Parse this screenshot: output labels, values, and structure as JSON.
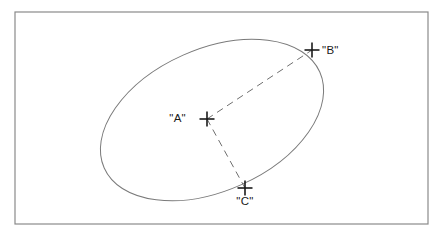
{
  "figure": {
    "kind": "geometry-diagram",
    "background_color": "#ffffff",
    "frame": {
      "name": "outer-frame",
      "x": 15,
      "y": 12,
      "width": 413,
      "height": 212,
      "stroke_color": "#8a8a8a",
      "stroke_width": 1.2,
      "fill": "none"
    },
    "ellipse": {
      "name": "ellipse-shape",
      "cx": 212,
      "cy": 120,
      "rx": 118,
      "ry": 71,
      "rotation_deg": -24,
      "stroke_color": "#7a7a7a",
      "stroke_width": 1,
      "fill": "none"
    },
    "points": [
      {
        "id": "A",
        "label": "\"A\"",
        "x": 207,
        "y": 119,
        "label_x": 186,
        "label_y": 122,
        "label_anchor": "end",
        "marker": "plus-cross",
        "marker_size": 7.5,
        "marker_color": "#1a1a1a",
        "marker_stroke_width": 1.6,
        "role": "center"
      },
      {
        "id": "B",
        "label": "\"B\"",
        "x": 312,
        "y": 50,
        "label_x": 322,
        "label_y": 54,
        "label_anchor": "start",
        "marker": "plus-cross",
        "marker_size": 7.5,
        "marker_color": "#1a1a1a",
        "marker_stroke_width": 1.6,
        "role": "on-ellipse"
      },
      {
        "id": "C",
        "label": "\"C\"",
        "x": 245,
        "y": 188,
        "label_x": 245,
        "label_y": 205,
        "label_anchor": "middle",
        "marker": "plus-cross",
        "marker_size": 7.5,
        "marker_color": "#1a1a1a",
        "marker_stroke_width": 1.6,
        "role": "on-ellipse"
      }
    ],
    "connectors": [
      {
        "name": "dashed-line-a-to-b",
        "from": "A",
        "to": "B",
        "x1": 207,
        "y1": 119,
        "x2": 312,
        "y2": 50,
        "style": "dashed",
        "dash_pattern": "7 5",
        "stroke_color": "#6f6f6f",
        "stroke_width": 1
      },
      {
        "name": "dashed-line-a-to-c",
        "from": "A",
        "to": "C",
        "x1": 207,
        "y1": 119,
        "x2": 245,
        "y2": 188,
        "style": "dashed",
        "dash_pattern": "7 5",
        "stroke_color": "#6f6f6f",
        "stroke_width": 1
      }
    ]
  }
}
